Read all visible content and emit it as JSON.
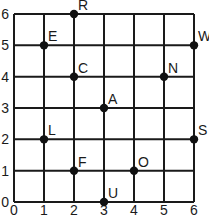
{
  "chart_data": {
    "type": "scatter",
    "title": "",
    "xlabel": "",
    "ylabel": "",
    "xlim": [
      0,
      6
    ],
    "ylim": [
      0,
      6
    ],
    "grid": true,
    "x_ticks": [
      "0",
      "1",
      "2",
      "3",
      "4",
      "5",
      "6"
    ],
    "y_ticks": [
      "0",
      "1",
      "2",
      "3",
      "4",
      "5",
      "6"
    ],
    "points": [
      {
        "label": "R",
        "x": 2,
        "y": 6
      },
      {
        "label": "E",
        "x": 1,
        "y": 5
      },
      {
        "label": "W",
        "x": 6,
        "y": 5
      },
      {
        "label": "C",
        "x": 2,
        "y": 4
      },
      {
        "label": "N",
        "x": 5,
        "y": 4
      },
      {
        "label": "A",
        "x": 3,
        "y": 3
      },
      {
        "label": "L",
        "x": 1,
        "y": 2
      },
      {
        "label": "S",
        "x": 6,
        "y": 2
      },
      {
        "label": "F",
        "x": 2,
        "y": 1
      },
      {
        "label": "O",
        "x": 4,
        "y": 1
      },
      {
        "label": "U",
        "x": 3,
        "y": 0
      }
    ]
  }
}
